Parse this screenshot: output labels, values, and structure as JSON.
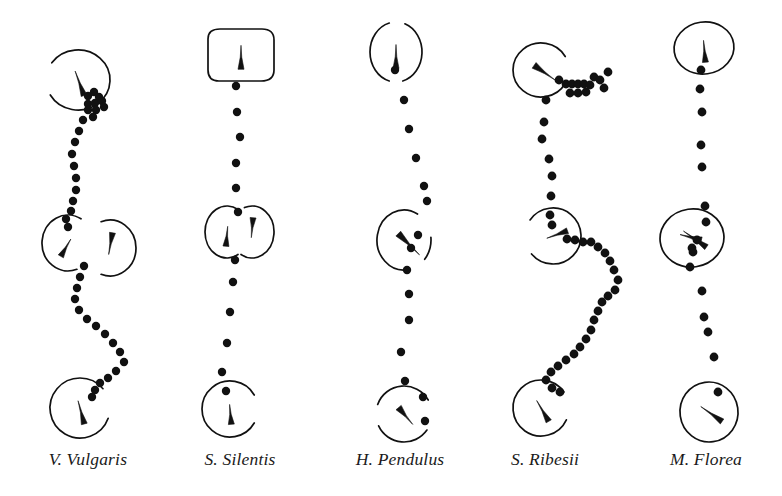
{
  "figure": {
    "background_color": "#ffffff",
    "ink_color": "#111111",
    "width": 782,
    "height": 496
  },
  "panels": [
    {
      "id": "v-vulgaris",
      "label": "V. Vulgaris",
      "label_x": 88,
      "track": {
        "dots": [
          [
            88,
            96
          ],
          [
            94,
            92
          ],
          [
            99,
            97
          ],
          [
            88,
            104
          ],
          [
            95,
            103
          ],
          [
            102,
            101
          ],
          [
            88,
            110
          ],
          [
            96,
            110
          ],
          [
            104,
            107
          ],
          [
            93,
            117
          ],
          [
            83,
            120
          ],
          [
            79,
            131
          ],
          [
            75,
            142
          ],
          [
            72,
            154
          ],
          [
            74,
            166
          ],
          [
            76,
            178
          ],
          [
            76,
            190
          ],
          [
            73,
            201
          ],
          [
            71,
            211
          ],
          [
            66,
            219
          ],
          [
            68,
            227
          ],
          [
            84,
            266
          ],
          [
            80,
            277
          ],
          [
            77,
            288
          ],
          [
            75,
            299
          ],
          [
            79,
            310
          ],
          [
            87,
            319
          ],
          [
            96,
            326
          ],
          [
            105,
            334
          ],
          [
            113,
            343
          ],
          [
            120,
            352
          ],
          [
            124,
            362
          ],
          [
            116,
            371
          ],
          [
            108,
            378
          ],
          [
            100,
            383
          ],
          [
            95,
            390
          ],
          [
            92,
            397
          ]
        ],
        "dot_radius": 4.2,
        "cluster_note": "dense dot cluster beneath top loop"
      },
      "markers": [
        {
          "type": "loop-open",
          "cx": 78,
          "cy": 80,
          "rx": 32,
          "ry": 30,
          "gap_deg": [
            150,
            215
          ],
          "wedge_deg": 250,
          "wedge_len": 26
        },
        {
          "type": "arc-left",
          "cx": 68,
          "cy": 243,
          "rx": 26,
          "ry": 28,
          "gap_deg": [
            300,
            70
          ],
          "wedge_deg": 300,
          "wedge_len": 20
        },
        {
          "type": "arc-right",
          "cx": 110,
          "cy": 248,
          "rx": 26,
          "ry": 28,
          "gap_deg": [
            110,
            250
          ],
          "wedge_deg": 100,
          "wedge_len": 22
        },
        {
          "type": "loop-open",
          "cx": 80,
          "cy": 408,
          "rx": 30,
          "ry": 30,
          "gap_deg": [
            320,
            20
          ],
          "wedge_deg": 255,
          "wedge_len": 24
        }
      ]
    },
    {
      "id": "s-silentis",
      "label": "S. Silentis",
      "label_x": 240,
      "track": {
        "dots": [
          [
            236,
            86
          ],
          [
            237,
            112
          ],
          [
            240,
            137
          ],
          [
            236,
            163
          ],
          [
            236,
            188
          ],
          [
            238,
            212
          ],
          [
            235,
            260
          ],
          [
            233,
            282
          ],
          [
            230,
            312
          ],
          [
            227,
            343
          ],
          [
            222,
            372
          ],
          [
            226,
            391
          ]
        ],
        "dot_radius": 4.2
      },
      "markers": [
        {
          "type": "loop-rounded-rect",
          "cx": 241,
          "cy": 55,
          "rx": 33,
          "ry": 26,
          "wedge_deg": 270,
          "wedge_len": 24
        },
        {
          "type": "arc-left",
          "cx": 227,
          "cy": 232,
          "rx": 22,
          "ry": 26,
          "gap_deg": [
            300,
            60
          ],
          "wedge_deg": 275,
          "wedge_len": 20
        },
        {
          "type": "arc-right",
          "cx": 252,
          "cy": 232,
          "rx": 22,
          "ry": 26,
          "gap_deg": [
            120,
            250
          ],
          "wedge_deg": 95,
          "wedge_len": 20
        },
        {
          "type": "loop-open",
          "cx": 230,
          "cy": 409,
          "rx": 28,
          "ry": 28,
          "gap_deg": [
            330,
            30
          ],
          "wedge_deg": 265,
          "wedge_len": 20
        }
      ]
    },
    {
      "id": "h-pendulus",
      "label": "H. Pendulus",
      "label_x": 400,
      "track": {
        "dots": [
          [
            395,
            70
          ],
          [
            404,
            100
          ],
          [
            409,
            129
          ],
          [
            416,
            158
          ],
          [
            424,
            186
          ],
          [
            427,
            201
          ],
          [
            418,
            235
          ],
          [
            411,
            248
          ],
          [
            407,
            270
          ],
          [
            409,
            294
          ],
          [
            409,
            320
          ],
          [
            401,
            352
          ],
          [
            405,
            381
          ],
          [
            423,
            397
          ],
          [
            425,
            421
          ]
        ],
        "dot_radius": 4.2
      },
      "markers": [
        {
          "type": "loop-broken",
          "cx": 396,
          "cy": 52,
          "rx": 26,
          "ry": 30,
          "gap_deg": [
            255,
            290
          ],
          "gap2_deg": [
            75,
            105
          ],
          "wedge_deg": 270,
          "wedge_len": 24
        },
        {
          "type": "loop-broken",
          "cx": 404,
          "cy": 240,
          "rx": 27,
          "ry": 30,
          "gap_deg": [
            300,
            355
          ],
          "gap2_deg": [
            40,
            80
          ],
          "wedge_deg": 45,
          "wedge_len": 30,
          "wedge_diagonal": true
        },
        {
          "type": "loop-broken",
          "cx": 404,
          "cy": 414,
          "rx": 28,
          "ry": 28,
          "gap_deg": [
            330,
            35
          ],
          "gap2_deg": [
            155,
            200
          ],
          "wedge_deg": 50,
          "wedge_len": 22,
          "wedge_diagonal": true
        }
      ]
    },
    {
      "id": "s-ribesii",
      "label": "S. Ribesii",
      "label_x": 545,
      "track": {
        "dots": [
          [
            559,
            80
          ],
          [
            566,
            84
          ],
          [
            572,
            84
          ],
          [
            578,
            84
          ],
          [
            584,
            84
          ],
          [
            590,
            85
          ],
          [
            570,
            93
          ],
          [
            578,
            93
          ],
          [
            586,
            92
          ],
          [
            594,
            77
          ],
          [
            600,
            80
          ],
          [
            604,
            88
          ],
          [
            608,
            72
          ],
          [
            546,
            100
          ],
          [
            544,
            122
          ],
          [
            542,
            139
          ],
          [
            549,
            159
          ],
          [
            552,
            176
          ],
          [
            551,
            196
          ],
          [
            550,
            215
          ],
          [
            552,
            225
          ],
          [
            567,
            239
          ],
          [
            575,
            240
          ],
          [
            583,
            242
          ],
          [
            591,
            242
          ],
          [
            598,
            247
          ],
          [
            605,
            253
          ],
          [
            610,
            261
          ],
          [
            614,
            270
          ],
          [
            618,
            280
          ],
          [
            615,
            290
          ],
          [
            608,
            296
          ],
          [
            602,
            302
          ],
          [
            598,
            311
          ],
          [
            594,
            320
          ],
          [
            591,
            330
          ],
          [
            586,
            339
          ],
          [
            580,
            347
          ],
          [
            574,
            354
          ],
          [
            566,
            360
          ],
          [
            558,
            366
          ],
          [
            551,
            372
          ],
          [
            546,
            380
          ],
          [
            552,
            388
          ],
          [
            560,
            392
          ]
        ],
        "dot_radius": 4.4
      },
      "markers": [
        {
          "type": "loop-open",
          "cx": 541,
          "cy": 70,
          "rx": 28,
          "ry": 27,
          "gap_deg": [
            330,
            30
          ],
          "wedge_deg": 35,
          "wedge_len": 26,
          "wedge_diagonal": true,
          "arrowhead": true
        },
        {
          "type": "arc-c",
          "cx": 553,
          "cy": 236,
          "rx": 28,
          "ry": 28,
          "gap_deg": [
            140,
            215
          ],
          "wedge_deg": 160,
          "wedge_len": 22
        },
        {
          "type": "loop-open",
          "cx": 541,
          "cy": 408,
          "rx": 28,
          "ry": 28,
          "gap_deg": [
            325,
            25
          ],
          "wedge_deg": 240,
          "wedge_len": 24
        }
      ]
    },
    {
      "id": "m-florea",
      "label": "M. Florea",
      "label_x": 706,
      "track": {
        "dots": [
          [
            701,
            70
          ],
          [
            700,
            89
          ],
          [
            702,
            112
          ],
          [
            701,
            145
          ],
          [
            702,
            167
          ],
          [
            705,
            206
          ],
          [
            706,
            222
          ],
          [
            697,
            240
          ],
          [
            692,
            248
          ],
          [
            693,
            252
          ],
          [
            690,
            267
          ],
          [
            702,
            291
          ],
          [
            704,
            317
          ],
          [
            708,
            332
          ],
          [
            714,
            357
          ],
          [
            718,
            392
          ]
        ],
        "dot_radius": 4.4
      },
      "markers": [
        {
          "type": "loop-oval",
          "cx": 704,
          "cy": 48,
          "rx": 30,
          "ry": 26,
          "wedge_deg": 265,
          "wedge_len": 22
        },
        {
          "type": "loop-oval",
          "cx": 692,
          "cy": 238,
          "rx": 32,
          "ry": 29,
          "wedge_deg": 215,
          "wedge_len": 28,
          "wedge2_deg": 195,
          "wedge2_len": 22
        },
        {
          "type": "loop-oval",
          "cx": 709,
          "cy": 412,
          "rx": 29,
          "ry": 30,
          "wedge_deg": 215,
          "wedge_len": 26
        }
      ]
    }
  ]
}
